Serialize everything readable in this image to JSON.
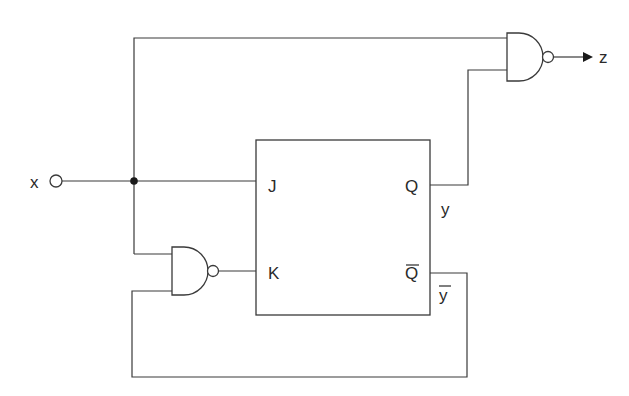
{
  "diagram": {
    "type": "sequential-logic-circuit",
    "input": {
      "label": "x"
    },
    "output": {
      "label": "z"
    },
    "flip_flop": {
      "type": "JK",
      "pins": {
        "j": "J",
        "k": "K",
        "q": "Q",
        "q_bar": "Q"
      },
      "outputs": {
        "q_signal": "y",
        "q_bar_signal": "y"
      }
    },
    "gates": [
      {
        "id": "output-nand",
        "type": "NAND",
        "inputs": [
          "x",
          "y"
        ],
        "output": "z"
      },
      {
        "id": "k-nand",
        "type": "NAND",
        "inputs": [
          "x",
          "y-bar"
        ],
        "output": "K"
      }
    ],
    "colors": {
      "line": "#3a3a3a",
      "background": "#ffffff"
    }
  }
}
